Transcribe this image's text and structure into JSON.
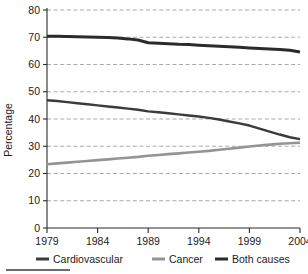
{
  "chart_data": {
    "type": "line",
    "title": "",
    "xlabel": "",
    "ylabel": "Percentage",
    "xlim": [
      1979,
      2004
    ],
    "ylim": [
      0,
      80
    ],
    "ytick_values": [
      0,
      10,
      20,
      30,
      40,
      50,
      60,
      70,
      80
    ],
    "ytick_labels": [
      "0",
      "10",
      "20",
      "30",
      "40",
      "50",
      "60",
      "70",
      "80"
    ],
    "xtick_values": [
      1979,
      1984,
      1989,
      1994,
      1999,
      2004
    ],
    "xtick_labels": [
      "1979",
      "1984",
      "1989",
      "1994",
      "1999",
      "2004"
    ],
    "grid": true,
    "grid_axis": "y",
    "legend_position": "below",
    "x": [
      1979,
      1980,
      1981,
      1982,
      1983,
      1984,
      1985,
      1986,
      1987,
      1988,
      1989,
      1990,
      1991,
      1992,
      1993,
      1994,
      1995,
      1996,
      1997,
      1998,
      1999,
      2000,
      2001,
      2002,
      2003,
      2004
    ],
    "series": [
      {
        "name": "Both causes",
        "color": "#2b2b2b",
        "width": 3.0,
        "values": [
          70.4,
          70.4,
          70.3,
          70.2,
          70.1,
          70.0,
          69.9,
          69.7,
          69.4,
          69.0,
          68.0,
          67.8,
          67.6,
          67.4,
          67.3,
          67.1,
          66.9,
          66.7,
          66.5,
          66.3,
          66.1,
          65.9,
          65.7,
          65.5,
          65.2,
          64.6
        ]
      },
      {
        "name": "Cardiovascular",
        "color": "#3b3b3b",
        "width": 2.4,
        "values": [
          46.9,
          46.6,
          46.2,
          45.8,
          45.4,
          45.0,
          44.6,
          44.2,
          43.8,
          43.4,
          42.8,
          42.5,
          42.1,
          41.7,
          41.3,
          40.9,
          40.4,
          39.8,
          39.1,
          38.4,
          37.6,
          36.5,
          35.4,
          34.3,
          33.3,
          32.6
        ]
      },
      {
        "name": "Cancer",
        "color": "#949494",
        "width": 2.6,
        "values": [
          23.4,
          23.7,
          24.0,
          24.3,
          24.6,
          24.9,
          25.2,
          25.5,
          25.8,
          26.1,
          26.5,
          26.8,
          27.1,
          27.4,
          27.7,
          28.0,
          28.3,
          28.7,
          29.1,
          29.5,
          29.9,
          30.3,
          30.6,
          30.9,
          31.1,
          31.3
        ]
      }
    ],
    "legend_entries": [
      {
        "label": "Cardiovascular",
        "color": "#3b3b3b",
        "width": 3.0
      },
      {
        "label": "Cancer",
        "color": "#949494",
        "width": 3.0
      },
      {
        "label": "Both causes",
        "color": "#2b2b2b",
        "width": 3.0
      }
    ]
  }
}
